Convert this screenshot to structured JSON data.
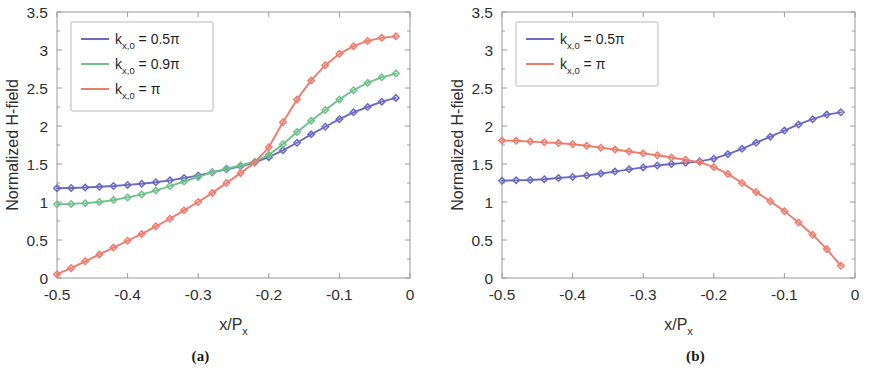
{
  "figure": {
    "panels": [
      {
        "id": "a",
        "caption": "(a)",
        "chart_data": {
          "type": "line",
          "title": "",
          "xlabel": "x/P",
          "xlabel_sub": "x",
          "ylabel": "Normalized H-field",
          "xlim": [
            -0.5,
            0
          ],
          "ylim": [
            0,
            3.5
          ],
          "xticks": [
            -0.5,
            -0.4,
            -0.3,
            -0.2,
            -0.1,
            0
          ],
          "xtick_labels": [
            "-0.5",
            "-0.4",
            "-0.3",
            "-0.2",
            "-0.1",
            "0"
          ],
          "yticks": [
            0,
            0.5,
            1,
            1.5,
            2,
            2.5,
            3,
            3.5
          ],
          "ytick_labels": [
            "0",
            "0.5",
            "1",
            "1.5",
            "2",
            "2.5",
            "3",
            "3.5"
          ],
          "grid": false,
          "legend_position": "upper-left",
          "marker": "diamond",
          "x": [
            -0.5,
            -0.48,
            -0.46,
            -0.44,
            -0.42,
            -0.4,
            -0.38,
            -0.36,
            -0.34,
            -0.32,
            -0.3,
            -0.28,
            -0.26,
            -0.24,
            -0.22,
            -0.2,
            -0.18,
            -0.16,
            -0.14,
            -0.12,
            -0.1,
            -0.08,
            -0.06,
            -0.04,
            -0.02
          ],
          "series": [
            {
              "name": "k_x0_0.5pi",
              "label_main": "k",
              "label_sub": "x,0",
              "label_tail": " = 0.5π",
              "color": "#6a6ac4",
              "values": [
                1.18,
                1.185,
                1.19,
                1.2,
                1.21,
                1.225,
                1.24,
                1.26,
                1.285,
                1.315,
                1.35,
                1.39,
                1.43,
                1.47,
                1.52,
                1.59,
                1.68,
                1.78,
                1.89,
                1.99,
                2.09,
                2.18,
                2.25,
                2.32,
                2.37
              ]
            },
            {
              "name": "k_x0_0.9pi",
              "label_main": "k",
              "label_sub": "x,0",
              "label_tail": " = 0.9π",
              "color": "#6fc08a",
              "values": [
                0.97,
                0.975,
                0.985,
                1.0,
                1.025,
                1.06,
                1.1,
                1.15,
                1.21,
                1.27,
                1.33,
                1.39,
                1.44,
                1.48,
                1.53,
                1.62,
                1.76,
                1.92,
                2.07,
                2.21,
                2.35,
                2.47,
                2.57,
                2.64,
                2.69
              ]
            },
            {
              "name": "k_x0_pi",
              "label_main": "k",
              "label_sub": "x,0",
              "label_tail": " = π",
              "color": "#ef7b6b",
              "values": [
                0.05,
                0.13,
                0.22,
                0.31,
                0.4,
                0.49,
                0.58,
                0.68,
                0.78,
                0.89,
                1.0,
                1.12,
                1.25,
                1.38,
                1.52,
                1.72,
                2.05,
                2.35,
                2.6,
                2.8,
                2.95,
                3.05,
                3.12,
                3.16,
                3.18
              ]
            }
          ]
        }
      },
      {
        "id": "b",
        "caption": "(b)",
        "chart_data": {
          "type": "line",
          "title": "",
          "xlabel": "x/P",
          "xlabel_sub": "x",
          "ylabel": "Normalized H-field",
          "xlim": [
            -0.5,
            0
          ],
          "ylim": [
            0,
            3.5
          ],
          "xticks": [
            -0.5,
            -0.4,
            -0.3,
            -0.2,
            -0.1,
            0
          ],
          "xtick_labels": [
            "-0.5",
            "-0.4",
            "-0.3",
            "-0.2",
            "-0.1",
            "0"
          ],
          "yticks": [
            0,
            0.5,
            1,
            1.5,
            2,
            2.5,
            3,
            3.5
          ],
          "ytick_labels": [
            "0",
            "0.5",
            "1",
            "1.5",
            "2",
            "2.5",
            "3",
            "3.5"
          ],
          "grid": false,
          "legend_position": "upper-left",
          "marker": "diamond",
          "x": [
            -0.5,
            -0.48,
            -0.46,
            -0.44,
            -0.42,
            -0.4,
            -0.38,
            -0.36,
            -0.34,
            -0.32,
            -0.3,
            -0.28,
            -0.26,
            -0.24,
            -0.22,
            -0.2,
            -0.18,
            -0.16,
            -0.14,
            -0.12,
            -0.1,
            -0.08,
            -0.06,
            -0.04,
            -0.02
          ],
          "series": [
            {
              "name": "k_x0_0.5pi",
              "label_main": "k",
              "label_sub": "x,0",
              "label_tail": " = 0.5π",
              "color": "#6a6ac4",
              "values": [
                1.28,
                1.285,
                1.29,
                1.3,
                1.315,
                1.33,
                1.35,
                1.375,
                1.4,
                1.43,
                1.455,
                1.48,
                1.5,
                1.515,
                1.535,
                1.57,
                1.63,
                1.7,
                1.78,
                1.86,
                1.94,
                2.02,
                2.09,
                2.15,
                2.18
              ]
            },
            {
              "name": "k_x0_pi",
              "label_main": "k",
              "label_sub": "x,0",
              "label_tail": " = π",
              "color": "#ef7b6b",
              "values": [
                1.81,
                1.805,
                1.795,
                1.785,
                1.775,
                1.76,
                1.74,
                1.715,
                1.69,
                1.665,
                1.64,
                1.615,
                1.585,
                1.555,
                1.525,
                1.46,
                1.37,
                1.25,
                1.13,
                1.01,
                0.88,
                0.73,
                0.57,
                0.38,
                0.16
              ]
            }
          ]
        }
      }
    ]
  }
}
